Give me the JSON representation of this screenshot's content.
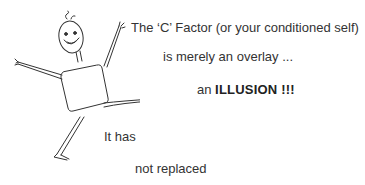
{
  "slide": {
    "illustration": {
      "description": "hand-drawn stick figure with square body, smiling face, arms raised and one leg kicked out",
      "icon": "stick-figure-illustration"
    },
    "lines": [
      {
        "text": "The ‘C’ Factor (or your conditioned self)"
      },
      {
        "text": "is merely an overlay ..."
      },
      {
        "prefix": "an ",
        "emphasis": "ILLUSION !!!"
      },
      {
        "text": "It has"
      },
      {
        "text": "not replaced"
      }
    ]
  }
}
